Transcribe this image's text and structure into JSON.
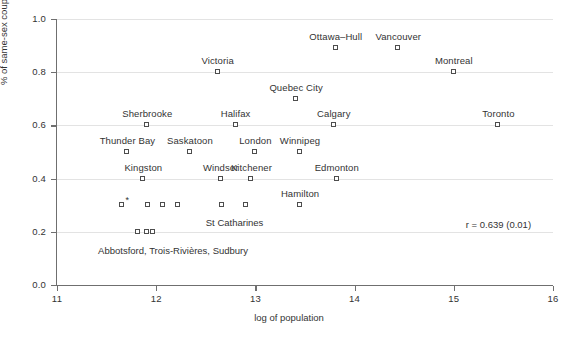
{
  "chart_data": {
    "type": "scatter",
    "title": "",
    "xlabel": "log of population",
    "ylabel": "% of same-sex couples",
    "xlim": [
      11,
      16
    ],
    "ylim": [
      0.0,
      1.0
    ],
    "xticks": [
      "11",
      "12",
      "13",
      "14",
      "15",
      "16"
    ],
    "yticks": [
      "0.0",
      "0.2",
      "0.4",
      "0.6",
      "0.8",
      "1.0"
    ],
    "grid": "horizontal",
    "legend": "none",
    "annotation": "r = 0.639 (0.01)",
    "group_note": "Abbotsford, Trois-Rivières, Sudbury",
    "star_note": "*",
    "points": [
      {
        "label": "Ottawa–Hull",
        "x": 13.81,
        "y": 0.89,
        "label_dx": 0,
        "label_dy": -13
      },
      {
        "label": "Vancouver",
        "x": 14.44,
        "y": 0.89,
        "label_dx": 0,
        "label_dy": -13
      },
      {
        "label": "Montreal",
        "x": 15.0,
        "y": 0.8,
        "label_dx": 0,
        "label_dy": -13
      },
      {
        "label": "Victoria",
        "x": 12.62,
        "y": 0.8,
        "label_dx": 0,
        "label_dy": -13
      },
      {
        "label": "Quebec City",
        "x": 13.41,
        "y": 0.7,
        "label_dx": 0,
        "label_dy": -13
      },
      {
        "label": "Sherbrooke",
        "x": 11.91,
        "y": 0.6,
        "label_dx": 0,
        "label_dy": -13
      },
      {
        "label": "Halifax",
        "x": 12.8,
        "y": 0.6,
        "label_dx": 0,
        "label_dy": -13
      },
      {
        "label": "Calgary",
        "x": 13.79,
        "y": 0.6,
        "label_dx": 0,
        "label_dy": -13
      },
      {
        "label": "Toronto",
        "x": 15.45,
        "y": 0.6,
        "label_dx": 0,
        "label_dy": -13
      },
      {
        "label": "Thunder Bay",
        "x": 11.71,
        "y": 0.5,
        "label_dx": 0,
        "label_dy": -13
      },
      {
        "label": "Saskatoon",
        "x": 12.34,
        "y": 0.5,
        "label_dx": 0,
        "label_dy": -13
      },
      {
        "label": "London",
        "x": 13.0,
        "y": 0.5,
        "label_dx": 0,
        "label_dy": -13
      },
      {
        "label": "Winnipeg",
        "x": 13.45,
        "y": 0.5,
        "label_dx": 0,
        "label_dy": -13
      },
      {
        "label": "Kingston",
        "x": 11.87,
        "y": 0.4,
        "label_dx": 0,
        "label_dy": -13
      },
      {
        "label": "Windsor",
        "x": 12.65,
        "y": 0.4,
        "label_dx": 0,
        "label_dy": -13
      },
      {
        "label": "Kitchener",
        "x": 12.96,
        "y": 0.4,
        "label_dx": 0,
        "label_dy": -13
      },
      {
        "label": "Edmonton",
        "x": 13.82,
        "y": 0.4,
        "label_dx": 0,
        "label_dy": -13
      },
      {
        "label": "Hamilton",
        "x": 13.45,
        "y": 0.3,
        "label_dx": 0,
        "label_dy": -13
      },
      {
        "label": "",
        "x": 11.66,
        "y": 0.3,
        "label_dx": 0,
        "label_dy": 0
      },
      {
        "label": "",
        "x": 11.92,
        "y": 0.3,
        "label_dx": 0,
        "label_dy": 0
      },
      {
        "label": "",
        "x": 12.07,
        "y": 0.3,
        "label_dx": 0,
        "label_dy": 0
      },
      {
        "label": "",
        "x": 12.22,
        "y": 0.3,
        "label_dx": 0,
        "label_dy": 0
      },
      {
        "label": "",
        "x": 12.66,
        "y": 0.3,
        "label_dx": 0,
        "label_dy": 0
      },
      {
        "label": "",
        "x": 12.91,
        "y": 0.3,
        "label_dx": 0,
        "label_dy": 0
      },
      {
        "label": "",
        "x": 11.82,
        "y": 0.2,
        "label_dx": 0,
        "label_dy": 0
      },
      {
        "label": "",
        "x": 11.91,
        "y": 0.2,
        "label_dx": 0,
        "label_dy": 0
      },
      {
        "label": "",
        "x": 11.97,
        "y": 0.2,
        "label_dx": 0,
        "label_dy": 0
      }
    ],
    "cluster_labels": [
      {
        "text": "St Catharines",
        "x": 12.79,
        "y": 0.3,
        "dx": 0,
        "dy": 12
      },
      {
        "text": "Abbotsford, Trois-Rivières, Sudbury",
        "x": 12.17,
        "y": 0.2,
        "dx": 0,
        "dy": 13
      }
    ]
  }
}
